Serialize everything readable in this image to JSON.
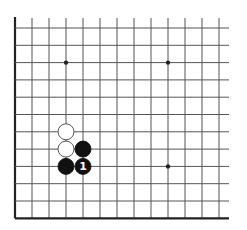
{
  "board": {
    "type": "go-diagram",
    "view": "partial (lower-left corner region)",
    "columns": 13,
    "rows": 12,
    "origin_x": 15,
    "origin_y": 28,
    "spacing_x": 17,
    "spacing_y": 17.3,
    "line_top_overhang": 10,
    "line_right_overhang": 10,
    "edges": [
      "left",
      "bottom"
    ],
    "colors": {
      "background": "#ffffff",
      "grid": "#555555",
      "edge": "#222222",
      "black_stone": "#111111",
      "white_stone": "#ffffff",
      "white_stone_outline": "#444444",
      "label_on_black": "#ffffff"
    },
    "star_points": [
      {
        "col": 3,
        "row": 2
      },
      {
        "col": 9,
        "row": 2
      },
      {
        "col": 9,
        "row": 8
      }
    ],
    "stones": [
      {
        "color": "white",
        "col": 3,
        "row": 6,
        "label": ""
      },
      {
        "color": "white",
        "col": 3,
        "row": 7,
        "label": ""
      },
      {
        "color": "black",
        "col": 4,
        "row": 7,
        "label": ""
      },
      {
        "color": "black",
        "col": 3,
        "row": 8,
        "label": ""
      },
      {
        "color": "black",
        "col": 4,
        "row": 8,
        "label": "1"
      }
    ]
  }
}
